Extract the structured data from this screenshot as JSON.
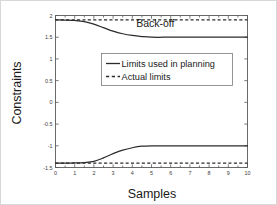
{
  "chart_data": {
    "type": "line",
    "title": "",
    "xlabel": "Samples",
    "ylabel": "Constraints",
    "xlim": [
      0,
      10
    ],
    "ylim": [
      -1.5,
      2
    ],
    "grid": false,
    "legend_position": "center",
    "xticks": [
      "0",
      "1",
      "2",
      "3",
      "4",
      "5",
      "6",
      "7",
      "8",
      "9",
      "10"
    ],
    "xtick_values": [
      0,
      1,
      2,
      3,
      4,
      5,
      6,
      7,
      8,
      9,
      10
    ],
    "yticks": [
      "2",
      "1.5",
      "1",
      "0.5",
      "0",
      "-0.5",
      "-1",
      "-1.5"
    ],
    "ytick_values": [
      2,
      1.5,
      1,
      0.5,
      0,
      -0.5,
      -1,
      -1.5
    ],
    "annotations": [
      {
        "text": "Back-off",
        "x": 5.2,
        "y": 1.74
      }
    ],
    "series": [
      {
        "name": "Limits used in planning",
        "style": "solid",
        "color": "#2b2b2b",
        "x": [
          0,
          0.5,
          1,
          1.5,
          2,
          2.5,
          3,
          3.5,
          4,
          4.5,
          5,
          6,
          7,
          8,
          9,
          10
        ],
        "values": [
          1.9,
          1.895,
          1.885,
          1.86,
          1.8,
          1.72,
          1.64,
          1.58,
          1.54,
          1.515,
          1.5,
          1.5,
          1.5,
          1.5,
          1.5,
          1.5
        ]
      },
      {
        "name": "Limits used in planning (lower)",
        "style": "solid",
        "color": "#2b2b2b",
        "x": [
          0,
          0.5,
          1,
          1.5,
          2,
          2.5,
          3,
          3.5,
          4,
          4.5,
          5,
          6,
          7,
          8,
          9,
          10
        ],
        "values": [
          -1.4,
          -1.4,
          -1.395,
          -1.385,
          -1.36,
          -1.28,
          -1.18,
          -1.1,
          -1.045,
          -1.01,
          -1.0,
          -1.0,
          -1.0,
          -1.0,
          -1.0,
          -1.0
        ]
      },
      {
        "name": "Actual limits",
        "style": "dashed",
        "color": "#2b2b2b",
        "x": [
          0,
          10
        ],
        "values": [
          1.9,
          1.9
        ]
      },
      {
        "name": "Actual limits (lower)",
        "style": "dashed",
        "color": "#2b2b2b",
        "x": [
          0,
          10
        ],
        "values": [
          -1.4,
          -1.4
        ]
      }
    ],
    "legend": [
      {
        "label": "Limits used in planning",
        "style": "solid"
      },
      {
        "label": "Actual limits",
        "style": "dashed"
      }
    ]
  }
}
